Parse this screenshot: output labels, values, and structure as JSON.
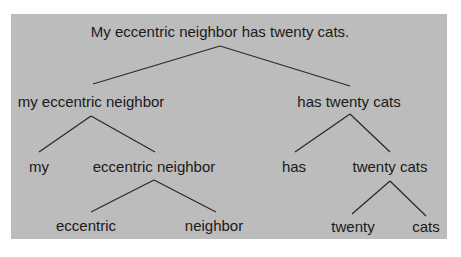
{
  "diagram": {
    "type": "syntax-tree",
    "background_color": "#bcbcbc",
    "line_color": "#2a2a2a",
    "nodes": [
      {
        "id": "root",
        "label": "My eccentric neighbor has twenty cats.",
        "x": 220,
        "y": 24
      },
      {
        "id": "np",
        "label": "my eccentric neighbor",
        "x": 91,
        "y": 94
      },
      {
        "id": "vp",
        "label": "has twenty cats",
        "x": 349,
        "y": 94
      },
      {
        "id": "my",
        "label": "my",
        "x": 39,
        "y": 159
      },
      {
        "id": "en",
        "label": "eccentric neighbor",
        "x": 154,
        "y": 159
      },
      {
        "id": "has",
        "label": "has",
        "x": 294,
        "y": 159
      },
      {
        "id": "tc",
        "label": "twenty cats",
        "x": 390,
        "y": 159
      },
      {
        "id": "eccentric",
        "label": "eccentric",
        "x": 86,
        "y": 218
      },
      {
        "id": "neighbor",
        "label": "neighbor",
        "x": 214,
        "y": 218
      },
      {
        "id": "twenty",
        "label": "twenty",
        "x": 353,
        "y": 219
      },
      {
        "id": "cats",
        "label": "cats",
        "x": 426,
        "y": 219
      }
    ],
    "edges": [
      {
        "from": "root",
        "to": "np",
        "x1": 220,
        "y1": 46,
        "x2": 93,
        "y2": 84
      },
      {
        "from": "root",
        "to": "vp",
        "x1": 220,
        "y1": 46,
        "x2": 350,
        "y2": 86
      },
      {
        "from": "np",
        "to": "my",
        "x1": 91,
        "y1": 116,
        "x2": 39,
        "y2": 152
      },
      {
        "from": "np",
        "to": "en",
        "x1": 91,
        "y1": 116,
        "x2": 155,
        "y2": 152
      },
      {
        "from": "vp",
        "to": "has",
        "x1": 350,
        "y1": 114,
        "x2": 295,
        "y2": 152
      },
      {
        "from": "vp",
        "to": "tc",
        "x1": 350,
        "y1": 114,
        "x2": 390,
        "y2": 152
      },
      {
        "from": "en",
        "to": "eccentric",
        "x1": 154,
        "y1": 180,
        "x2": 91,
        "y2": 212
      },
      {
        "from": "en",
        "to": "neighbor",
        "x1": 154,
        "y1": 180,
        "x2": 216,
        "y2": 212
      },
      {
        "from": "tc",
        "to": "twenty",
        "x1": 390,
        "y1": 181,
        "x2": 352,
        "y2": 214
      },
      {
        "from": "tc",
        "to": "cats",
        "x1": 390,
        "y1": 181,
        "x2": 426,
        "y2": 216
      }
    ]
  }
}
